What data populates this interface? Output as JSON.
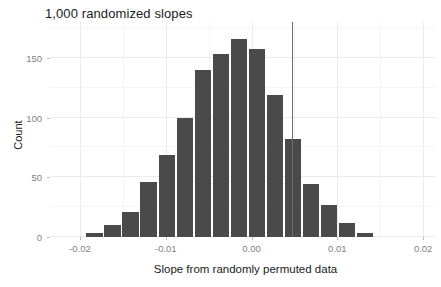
{
  "chart_data": {
    "type": "bar",
    "title": "1,000 randomized slopes",
    "xlabel": "Slope from randomly permuted data",
    "ylabel": "Count",
    "xlim": [
      -0.0235,
      0.0215
    ],
    "ylim": [
      0,
      180
    ],
    "grid": true,
    "legend": null,
    "binwidth": 0.0021,
    "x_ticks": [
      -0.02,
      -0.01,
      0.0,
      0.01,
      0.02
    ],
    "x_tick_labels": [
      "-0.02",
      "-0.01",
      "0.00",
      "0.01",
      "0.02"
    ],
    "y_ticks": [
      0,
      50,
      100,
      150
    ],
    "y_tick_labels": [
      "0",
      "50",
      "100",
      "150"
    ],
    "bar_color": "#4a4a4a",
    "bins": [
      {
        "center": -0.0182,
        "value": 3
      },
      {
        "center": -0.0161,
        "value": 10
      },
      {
        "center": -0.014,
        "value": 21
      },
      {
        "center": -0.0119,
        "value": 46
      },
      {
        "center": -0.0098,
        "value": 69
      },
      {
        "center": -0.0077,
        "value": 100
      },
      {
        "center": -0.0056,
        "value": 140
      },
      {
        "center": -0.0035,
        "value": 153
      },
      {
        "center": -0.0014,
        "value": 166
      },
      {
        "center": 0.0007,
        "value": 157
      },
      {
        "center": 0.0028,
        "value": 119
      },
      {
        "center": 0.0049,
        "value": 82
      },
      {
        "center": 0.007,
        "value": 44
      },
      {
        "center": 0.0091,
        "value": 27
      },
      {
        "center": 0.0112,
        "value": 12
      },
      {
        "center": 0.0133,
        "value": 3
      }
    ],
    "reference_line": {
      "x": 0.0047,
      "y_top": 180,
      "color": "#6e6e6e",
      "label": "observed slope"
    }
  }
}
